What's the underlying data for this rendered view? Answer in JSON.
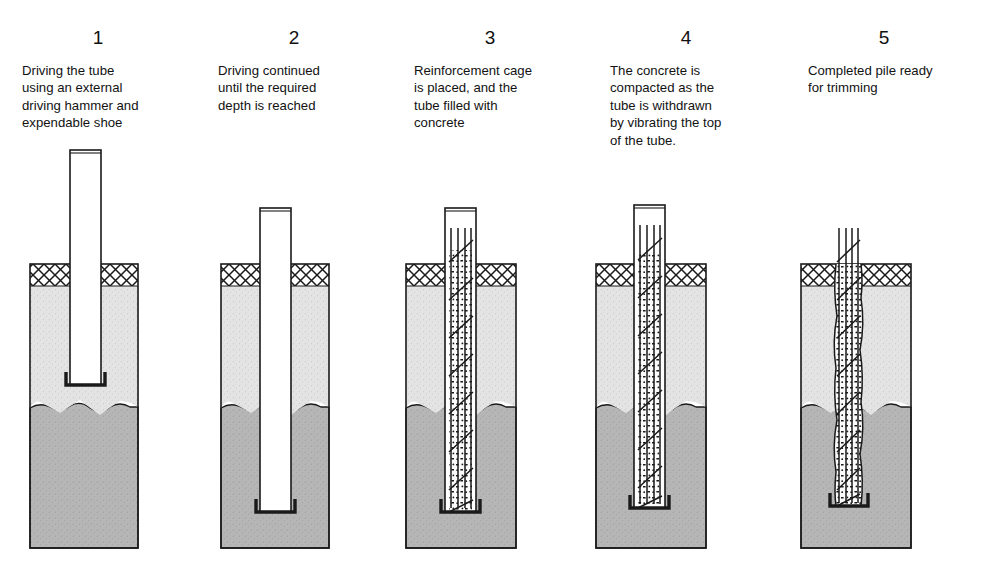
{
  "figure": {
    "panel_count": 5,
    "colors": {
      "background": "#ffffff",
      "outline": "#1a1a1a",
      "upper_soil": "#e2e2e2",
      "lower_soil": "#b4b4b4",
      "surface_hatch": "#ffffff",
      "tube_fill": "#ffffff",
      "concrete_fill": "#fbfbfb",
      "rebar": "#1a1a1a",
      "shoe": "#1a1a1a",
      "text": "#121212"
    }
  },
  "panels": [
    {
      "number": "1",
      "caption": "Driving the tube using an external driving hammer and expendable shoe",
      "caption_lines": [
        "Driving the tube",
        "using an external",
        "driving hammer and",
        "expendable shoe"
      ],
      "elements": {
        "tube": true,
        "tube_top_y": 150,
        "tube_bottom_y": 385,
        "shoe": true,
        "rebar_cage": false,
        "concrete": false,
        "concrete_irregular": false
      }
    },
    {
      "number": "2",
      "caption": "Driving continued until the required depth is reached",
      "caption_lines": [
        "Driving continued",
        "until the required",
        "depth is reached"
      ],
      "elements": {
        "tube": true,
        "tube_top_y": 208,
        "tube_bottom_y": 512,
        "shoe": true,
        "rebar_cage": false,
        "concrete": false,
        "concrete_irregular": false
      }
    },
    {
      "number": "3",
      "caption": "Reinforcement cage is placed, and the tube filled with concrete",
      "caption_lines": [
        "Reinforcement cage",
        "is placed, and the",
        "tube filled with",
        "concrete"
      ],
      "elements": {
        "tube": true,
        "tube_top_y": 208,
        "tube_bottom_y": 512,
        "shoe": true,
        "rebar_cage": true,
        "concrete": true,
        "concrete_irregular": false
      }
    },
    {
      "number": "4",
      "caption": "The concrete is compacted as the tube is withdrawn by vibrating the top of the tube.",
      "caption_lines": [
        "The concrete is",
        "compacted as the",
        "tube is withdrawn",
        "by vibrating the top",
        "of the tube."
      ],
      "elements": {
        "tube": true,
        "tube_top_y": 205,
        "tube_bottom_y": 508,
        "shoe": true,
        "rebar_cage": true,
        "concrete": true,
        "concrete_irregular": false
      }
    },
    {
      "number": "5",
      "caption": "Completed pile ready for trimming",
      "caption_lines": [
        "Completed pile ready",
        "for trimming"
      ],
      "elements": {
        "tube": false,
        "tube_top_y": null,
        "tube_bottom_y": null,
        "shoe": true,
        "rebar_cage": true,
        "concrete": true,
        "concrete_irregular": true
      }
    }
  ],
  "ground": {
    "surface_band_label": "ground surface hatching",
    "upper_layer_label": "upper soil stratum",
    "lower_layer_label": "lower soil stratum",
    "surface_y": 264,
    "hatch_band_bottom_y": 286,
    "stratum_boundary_y": 408,
    "block_bottom_y": 548
  }
}
